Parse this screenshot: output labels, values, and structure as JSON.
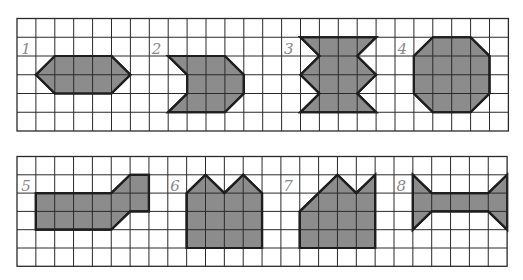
{
  "colors": {
    "grid": "#2a2a2a",
    "shape_fill": "#8c8c8c",
    "shape_stroke": "#1e1e1e",
    "label": "#8a8a8a",
    "background": "#ffffff"
  },
  "grids": [
    {
      "id": "top",
      "x": 17,
      "y": 18.5,
      "cols": 26,
      "rows": 6,
      "cell_w": 18.9,
      "cell_h": 18.75,
      "figures": [
        {
          "label": "1",
          "label_cell": [
            0.6,
            1.6
          ],
          "points": [
            [
              1,
              3
            ],
            [
              2,
              2
            ],
            [
              5,
              2
            ],
            [
              6,
              3
            ],
            [
              5,
              4
            ],
            [
              2,
              4
            ]
          ]
        },
        {
          "label": "2",
          "label_cell": [
            7.5,
            1.6
          ],
          "points": [
            [
              8,
              2
            ],
            [
              11,
              2
            ],
            [
              12,
              3
            ],
            [
              12,
              4
            ],
            [
              11,
              5
            ],
            [
              8,
              5
            ],
            [
              9,
              4
            ],
            [
              9,
              3
            ]
          ]
        },
        {
          "label": "3",
          "label_cell": [
            14.5,
            1.6
          ],
          "points": [
            [
              15,
              1
            ],
            [
              19,
              1
            ],
            [
              18,
              2
            ],
            [
              19,
              3
            ],
            [
              18,
              4
            ],
            [
              19,
              5
            ],
            [
              15,
              5
            ],
            [
              16,
              4
            ],
            [
              15,
              3
            ],
            [
              16,
              2
            ]
          ]
        },
        {
          "label": "4",
          "label_cell": [
            20.5,
            1.6
          ],
          "points": [
            [
              22,
              1
            ],
            [
              24,
              1
            ],
            [
              25,
              2
            ],
            [
              25,
              4
            ],
            [
              24,
              5
            ],
            [
              22,
              5
            ],
            [
              21,
              4
            ],
            [
              21,
              2
            ]
          ]
        }
      ]
    },
    {
      "id": "bottom",
      "x": 17,
      "y": 156.5,
      "cols": 26,
      "rows": 6,
      "cell_w": 18.85,
      "cell_h": 18.3,
      "figures": [
        {
          "label": "5",
          "label_cell": [
            0.6,
            1.6
          ],
          "points": [
            [
              1,
              2
            ],
            [
              5,
              2
            ],
            [
              6,
              1
            ],
            [
              7,
              1
            ],
            [
              7,
              3
            ],
            [
              6,
              3
            ],
            [
              5,
              4
            ],
            [
              1,
              4
            ]
          ]
        },
        {
          "label": "6",
          "label_cell": [
            8.5,
            1.6
          ],
          "points": [
            [
              9,
              2
            ],
            [
              10,
              1
            ],
            [
              11,
              2
            ],
            [
              12,
              1
            ],
            [
              13,
              2
            ],
            [
              13,
              5
            ],
            [
              9,
              5
            ]
          ]
        },
        {
          "label": "7",
          "label_cell": [
            14.5,
            1.6
          ],
          "points": [
            [
              15,
              3
            ],
            [
              17,
              1
            ],
            [
              18,
              2
            ],
            [
              19,
              1
            ],
            [
              19,
              5
            ],
            [
              15,
              5
            ]
          ]
        },
        {
          "label": "8",
          "label_cell": [
            20.5,
            1.6
          ],
          "points": [
            [
              21,
              1
            ],
            [
              22,
              2
            ],
            [
              25,
              2
            ],
            [
              26,
              1
            ],
            [
              26,
              4
            ],
            [
              25,
              3
            ],
            [
              22,
              3
            ],
            [
              21,
              4
            ]
          ]
        }
      ]
    }
  ]
}
